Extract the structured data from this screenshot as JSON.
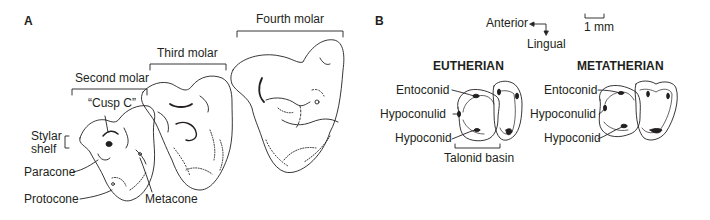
{
  "panel_a": {
    "letter": "A",
    "molar_labels": {
      "second": "Second molar",
      "third": "Third molar",
      "fourth": "Fourth molar"
    },
    "cusp_labels": {
      "cusp_c": "“Cusp C”",
      "stylar_shelf_line1": "Stylar",
      "stylar_shelf_line2": "shelf",
      "paracone": "Paracone",
      "protocone": "Protocone",
      "metacone": "Metacone"
    }
  },
  "panel_b": {
    "letter": "B",
    "orientation": {
      "anterior": "Anterior",
      "lingual": "Lingual"
    },
    "scale_bar": "1 mm",
    "groups": [
      {
        "title": "EUTHERIAN",
        "labels": [
          "Entoconid",
          "Hypoconulid",
          "Hypoconid"
        ],
        "basin_label": "Talonid basin"
      },
      {
        "title": "METATHERIAN",
        "labels": [
          "Entoconid",
          "Hypoconulid",
          "Hypoconid"
        ]
      }
    ]
  },
  "colors": {
    "ink": "#231f20",
    "background": "#ffffff"
  }
}
